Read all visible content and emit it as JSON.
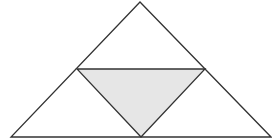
{
  "diagram": {
    "type": "geometry",
    "colors": {
      "stroke": "#333333",
      "shaded_fill": "#e6e6e6",
      "background": "#ffffff"
    },
    "outer_triangle": {
      "points": "140,2 11,137 271,137"
    },
    "medial_triangle": {
      "points": "77,69 205,69 141,137"
    }
  }
}
